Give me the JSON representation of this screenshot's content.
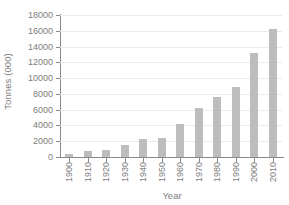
{
  "chart_data": {
    "type": "bar",
    "title": "",
    "subtitle": "",
    "xlabel": "Year",
    "ylabel": "Tonnes (000)",
    "categories": [
      "1900",
      "1910",
      "1920",
      "1930",
      "1940",
      "1950",
      "1960",
      "1970",
      "1980",
      "1990",
      "2000",
      "2010"
    ],
    "values": [
      400,
      750,
      900,
      1500,
      2300,
      2400,
      4200,
      6150,
      7600,
      8850,
      13200,
      16200
    ],
    "ylim": [
      0,
      18000
    ],
    "ytick_labels": [
      "0",
      "2000",
      "4000",
      "6000",
      "8000",
      "10000",
      "12000",
      "14000",
      "16000",
      "18000"
    ],
    "ytick_values": [
      0,
      2000,
      4000,
      6000,
      8000,
      10000,
      12000,
      14000,
      16000,
      18000
    ],
    "grid": true,
    "grid_axis": "y",
    "legend": false,
    "legend_position": "none",
    "bar_color": "#bdbdbd",
    "grid_color": "#ebebeb",
    "axis_color": "#8a8a8a",
    "text_color": "#7d7d7d",
    "background_color": "#ffffff",
    "xtick_rotation": -90
  }
}
